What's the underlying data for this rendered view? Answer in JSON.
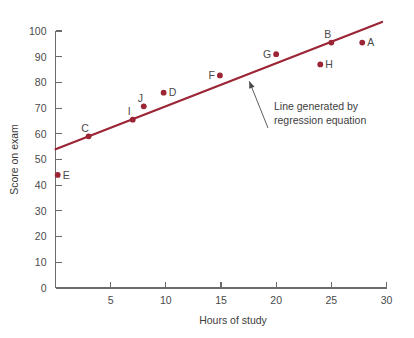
{
  "chart_data": {
    "type": "scatter",
    "title": "",
    "xlabel": "Hours of study",
    "ylabel": "Score on exam",
    "xlim": [
      0,
      30
    ],
    "ylim": [
      0,
      100
    ],
    "xticks": [
      0,
      5,
      10,
      15,
      20,
      25,
      30
    ],
    "xtick_labels": [
      "0",
      "5",
      "10",
      "15",
      "20",
      "25",
      "30"
    ],
    "yticks": [
      0,
      10,
      20,
      30,
      40,
      50,
      60,
      70,
      80,
      90,
      100
    ],
    "ytick_labels": [
      "0",
      "10",
      "20",
      "30",
      "40",
      "50",
      "60",
      "70",
      "80",
      "90",
      "100"
    ],
    "grid": false,
    "legend": "none",
    "point_color": "#9B2435",
    "line_color": "#9B2435",
    "axis_color": "#6b6b6b",
    "points": [
      {
        "label": "A",
        "x": 27.8,
        "y": 95.5,
        "label_pos": "right"
      },
      {
        "label": "B",
        "x": 25.0,
        "y": 95.5,
        "label_pos": "upleft"
      },
      {
        "label": "C",
        "x": 3.0,
        "y": 59.0,
        "label_pos": "upleft"
      },
      {
        "label": "D",
        "x": 9.8,
        "y": 76.0,
        "label_pos": "right"
      },
      {
        "label": "E",
        "x": 0.2,
        "y": 44.0,
        "label_pos": "right"
      },
      {
        "label": "F",
        "x": 14.9,
        "y": 82.7,
        "label_pos": "left"
      },
      {
        "label": "G",
        "x": 20.0,
        "y": 91.0,
        "label_pos": "left"
      },
      {
        "label": "H",
        "x": 24.0,
        "y": 87.0,
        "label_pos": "right"
      },
      {
        "label": "I",
        "x": 7.0,
        "y": 65.5,
        "label_pos": "upleft"
      },
      {
        "label": "J",
        "x": 8.0,
        "y": 70.7,
        "label_pos": "upleft"
      }
    ],
    "regression_line": {
      "x_start": 0.0,
      "y_start": 54.0,
      "x_end": 29.6,
      "y_end": 103.5,
      "slope": 1.672,
      "intercept": 54.0
    },
    "annotation": {
      "line1": "Line generated by",
      "line2": "regression equation",
      "arrow_tip_x": 17.2,
      "arrow_tip_y": 82.8
    }
  }
}
